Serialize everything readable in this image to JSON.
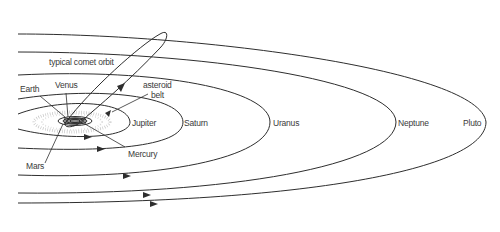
{
  "diagram": {
    "labels": {
      "comet": "typical comet orbit",
      "earth": "Earth",
      "venus": "Venus",
      "asteroid_line1": "asteroid",
      "asteroid_line2": "belt",
      "jupiter": "Jupiter",
      "saturn": "Saturn",
      "uranus": "Uranus",
      "neptune": "Neptune",
      "pluto": "Pluto",
      "mars": "Mars",
      "mercury": "Mercury"
    },
    "colors": {
      "line": "#2e2e2e",
      "text": "#3a3a3a",
      "belt": "#9a9a9a",
      "background": "#ffffff"
    }
  }
}
